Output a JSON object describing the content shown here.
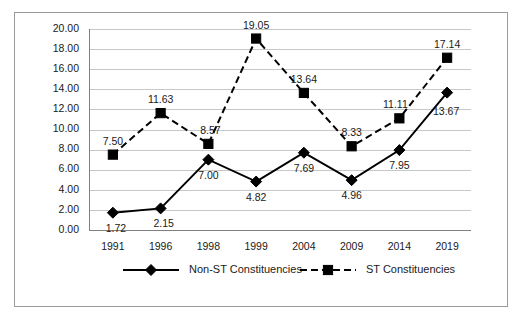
{
  "chart_data": {
    "type": "line",
    "title": "",
    "xlabel": "",
    "ylabel": "",
    "categories": [
      "1991",
      "1996",
      "1998",
      "1999",
      "2004",
      "2009",
      "2014",
      "2019"
    ],
    "ylim": [
      0,
      20
    ],
    "ytick_step": 2,
    "ytick_labels": [
      "0.00",
      "2.00",
      "4.00",
      "6.00",
      "8.00",
      "10.00",
      "12.00",
      "14.00",
      "16.00",
      "18.00",
      "20.00"
    ],
    "grid": true,
    "legend_position": "bottom",
    "series": [
      {
        "name": "Non-ST Constituencies",
        "marker": "diamond",
        "line_style": "solid",
        "color": "#000000",
        "values": [
          1.72,
          2.15,
          7.0,
          4.82,
          7.69,
          4.96,
          7.95,
          13.67
        ],
        "labels": [
          "1.72",
          "2.15",
          "7.00",
          "4.82",
          "7.69",
          "4.96",
          "7.95",
          "13.67"
        ]
      },
      {
        "name": "ST Constituencies",
        "marker": "square",
        "line_style": "dashed",
        "color": "#000000",
        "values": [
          7.5,
          11.63,
          8.57,
          19.05,
          13.64,
          8.33,
          11.11,
          17.14
        ],
        "labels": [
          "7.50",
          "11.63",
          "8.57",
          "19.05",
          "13.64",
          "8.33",
          "11.11",
          "17.14"
        ]
      }
    ]
  },
  "legend": {
    "items": [
      {
        "label": "Non-ST Constituencies"
      },
      {
        "label": "ST Constituencies"
      }
    ]
  }
}
